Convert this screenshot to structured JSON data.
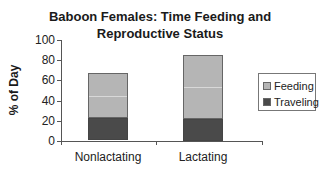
{
  "chart_data": {
    "type": "bar",
    "stacked": true,
    "title": "Baboon Females: Time Feeding and Reproductive Status",
    "title_lines": [
      "Baboon Females: Time Feeding and",
      "Reproductive Status"
    ],
    "xlabel": "",
    "ylabel": "% of Day",
    "ylim": [
      0,
      100
    ],
    "yticks": [
      0,
      20,
      40,
      60,
      80,
      100
    ],
    "categories": [
      "Nonlactating",
      "Lactating"
    ],
    "series": [
      {
        "name": "Traveling",
        "values": [
          22,
          22
        ],
        "color": "#4a4a4a"
      },
      {
        "name": "Feeding",
        "values": [
          45,
          63
        ],
        "color": "#b5b5b5"
      }
    ],
    "totals": [
      67,
      85
    ],
    "legend": {
      "position": "right",
      "entries": [
        "Feeding",
        "Traveling"
      ]
    },
    "grid": false
  }
}
